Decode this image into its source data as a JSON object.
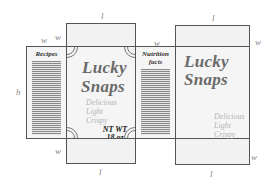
{
  "diagram": {
    "dimension_labels": {
      "length": "l",
      "width": "w",
      "height": "h"
    },
    "panels": {
      "recipes_side": {
        "label": "Recipes"
      },
      "front": {
        "brand_line1": "Lucky",
        "brand_line2": "Snaps",
        "tagline": [
          "Delicious",
          "Light",
          "Crispy"
        ],
        "net_weight_line1": "NT WT",
        "net_weight_line2": "18 oz"
      },
      "nutrition_side": {
        "label_line1": "Nutrition",
        "label_line2": "facts"
      },
      "back": {
        "brand_line1": "Lucky",
        "brand_line2": "Snaps",
        "tagline": [
          "Delicious",
          "Light",
          "Crispy"
        ]
      }
    },
    "colors": {
      "outline": "#555555",
      "panel_fill": "#f5f5f5",
      "brand_text": "#6a6a6a",
      "tagline_text": "#b4b4b4",
      "dimension_text": "#888888"
    }
  }
}
